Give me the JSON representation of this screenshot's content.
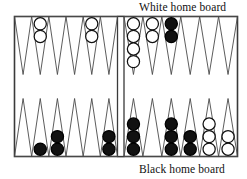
{
  "figure": {
    "kind": "backgammon-board-diagram",
    "labels": {
      "white_home_board": "White home board",
      "black_home_board": "Black home board"
    }
  },
  "colors": {
    "board_border": "#3a3a3a",
    "point_outline": "#4a4a4a",
    "board_background": "#ffffff",
    "white_checker_fill": "#ffffff",
    "white_checker_stroke": "#111111",
    "black_checker_fill": "#111111",
    "black_checker_stroke": "#000000",
    "label_text": "#111111",
    "bar_fill": "#ffffff"
  },
  "board": {
    "quadrants": [
      {
        "name": "top-left",
        "label": "",
        "points": [
          {
            "index": 1,
            "checkers": 0,
            "color": "none"
          },
          {
            "index": 2,
            "checkers": 2,
            "color": "white"
          },
          {
            "index": 3,
            "checkers": 0,
            "color": "none"
          },
          {
            "index": 4,
            "checkers": 0,
            "color": "none"
          },
          {
            "index": 5,
            "checkers": 2,
            "color": "white"
          },
          {
            "index": 6,
            "checkers": 0,
            "color": "none"
          }
        ]
      },
      {
        "name": "top-right",
        "label": "White home board",
        "points": [
          {
            "index": 1,
            "checkers": 4,
            "color": "white"
          },
          {
            "index": 2,
            "checkers": 2,
            "color": "white"
          },
          {
            "index": 3,
            "checkers": 2,
            "color": "black"
          },
          {
            "index": 4,
            "checkers": 0,
            "color": "none"
          },
          {
            "index": 5,
            "checkers": 0,
            "color": "none"
          },
          {
            "index": 6,
            "checkers": 0,
            "color": "none"
          }
        ]
      },
      {
        "name": "bottom-left",
        "label": "",
        "points": [
          {
            "index": 1,
            "checkers": 0,
            "color": "none"
          },
          {
            "index": 2,
            "checkers": 1,
            "color": "black"
          },
          {
            "index": 3,
            "checkers": 2,
            "color": "black"
          },
          {
            "index": 4,
            "checkers": 0,
            "color": "none"
          },
          {
            "index": 5,
            "checkers": 0,
            "color": "none"
          },
          {
            "index": 6,
            "checkers": 2,
            "color": "black"
          }
        ]
      },
      {
        "name": "bottom-right",
        "label": "Black home board",
        "points": [
          {
            "index": 1,
            "checkers": 3,
            "color": "black"
          },
          {
            "index": 2,
            "checkers": 0,
            "color": "none"
          },
          {
            "index": 3,
            "checkers": 3,
            "color": "black"
          },
          {
            "index": 4,
            "checkers": 2,
            "color": "black"
          },
          {
            "index": 5,
            "checkers": 3,
            "color": "white"
          },
          {
            "index": 6,
            "checkers": 2,
            "color": "white"
          }
        ]
      }
    ],
    "totals": {
      "white_on_board": 10,
      "black_on_board": 15
    }
  }
}
